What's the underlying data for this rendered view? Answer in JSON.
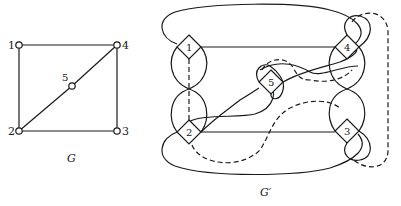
{
  "figure": {
    "left_graph": {
      "caption": "G",
      "nodes": [
        {
          "id": "1",
          "label": "1"
        },
        {
          "id": "2",
          "label": "2"
        },
        {
          "id": "3",
          "label": "3"
        },
        {
          "id": "4",
          "label": "4"
        },
        {
          "id": "5",
          "label": "5"
        }
      ],
      "edges": [
        [
          "1",
          "4"
        ],
        [
          "1",
          "2"
        ],
        [
          "2",
          "3"
        ],
        [
          "3",
          "4"
        ],
        [
          "2",
          "5"
        ],
        [
          "5",
          "4"
        ]
      ]
    },
    "right_graph": {
      "caption": "G′",
      "vertex_gadgets": [
        {
          "id": "1",
          "label": "1"
        },
        {
          "id": "2",
          "label": "2"
        },
        {
          "id": "3",
          "label": "3"
        },
        {
          "id": "4",
          "label": "4"
        },
        {
          "id": "5",
          "label": "5"
        }
      ],
      "line_styles": {
        "solid": "solid edge",
        "dashed": "dashed edge"
      }
    },
    "colors": {
      "ink": "#1a1a1a",
      "background": "#ffffff"
    }
  }
}
